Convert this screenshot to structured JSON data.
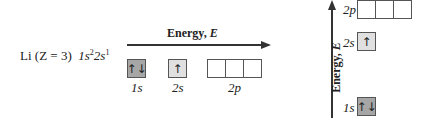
{
  "config": {
    "element": "Li",
    "z_label": "(Z = 3)",
    "term1": "1s",
    "sup1": "2",
    "term2": "2s",
    "sup2": "1"
  },
  "horizontal": {
    "axis_label": "Energy,",
    "axis_var": "E",
    "orbitals": [
      {
        "label": "1s",
        "occupancy": "↑↓"
      },
      {
        "label": "2s",
        "occupancy": "↑"
      },
      {
        "label": "2p",
        "occupancy": [
          "",
          "",
          ""
        ]
      }
    ]
  },
  "vertical": {
    "axis_label": "Energy,",
    "axis_var": "E",
    "orbitals": [
      {
        "label": "2p",
        "occupancy": [
          "",
          "",
          ""
        ]
      },
      {
        "label": "2s",
        "occupancy": "↑"
      },
      {
        "label": "1s",
        "occupancy": "↑↓"
      }
    ]
  }
}
